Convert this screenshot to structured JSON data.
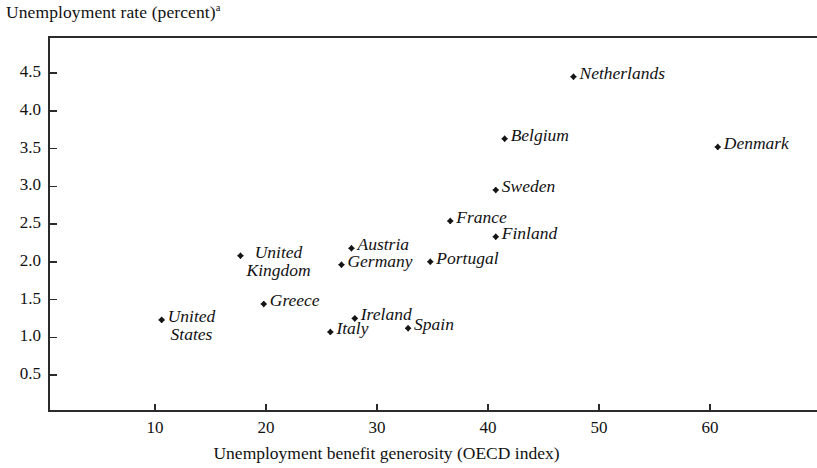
{
  "figure": {
    "y_axis_title": "Unemployment rate (percent)",
    "y_axis_title_superscript": "a",
    "x_axis_title": "Unemployment benefit generosity (OECD index)"
  },
  "chart_data": {
    "type": "scatter",
    "title": "",
    "ylabel": "Unemployment rate (percent)",
    "xlabel": "Unemployment benefit generosity (OECD index)",
    "xlim": [
      0,
      69
    ],
    "ylim": [
      0,
      4.9
    ],
    "xticks": [
      10,
      20,
      30,
      40,
      50,
      60
    ],
    "yticks": [
      0.5,
      1.0,
      1.5,
      2.0,
      2.5,
      3.0,
      3.5,
      4.0,
      4.5
    ],
    "ytick_labels": [
      "0.5",
      "1.0",
      "1.5",
      "2.0",
      "2.5",
      "3.0",
      "3.5",
      "4.0",
      "4.5"
    ],
    "xtick_labels": [
      "10",
      "20",
      "30",
      "40",
      "50",
      "60"
    ],
    "grid": false,
    "legend": false,
    "marker_color": "#151515",
    "points": [
      {
        "label": "United States",
        "label_lines": [
          "United",
          "States"
        ],
        "x": 10.6,
        "y": 1.23,
        "label_pos": "right-2line"
      },
      {
        "label": "United Kingdom",
        "label_lines": [
          "United",
          "Kingdom"
        ],
        "x": 17.7,
        "y": 2.08,
        "label_pos": "right-2line"
      },
      {
        "label": "Greece",
        "label_lines": [
          "Greece"
        ],
        "x": 19.8,
        "y": 1.44,
        "label_pos": "right"
      },
      {
        "label": "Italy",
        "label_lines": [
          "Italy"
        ],
        "x": 25.8,
        "y": 1.07,
        "label_pos": "right"
      },
      {
        "label": "Germany",
        "label_lines": [
          "Germany"
        ],
        "x": 26.8,
        "y": 1.96,
        "label_pos": "right"
      },
      {
        "label": "Austria",
        "label_lines": [
          "Austria"
        ],
        "x": 27.7,
        "y": 2.18,
        "label_pos": "right"
      },
      {
        "label": "Ireland",
        "label_lines": [
          "Ireland"
        ],
        "x": 28.0,
        "y": 1.25,
        "label_pos": "right"
      },
      {
        "label": "Spain",
        "label_lines": [
          "Spain"
        ],
        "x": 32.8,
        "y": 1.12,
        "label_pos": "right"
      },
      {
        "label": "Portugal",
        "label_lines": [
          "Portugal"
        ],
        "x": 34.8,
        "y": 2.0,
        "label_pos": "right"
      },
      {
        "label": "France",
        "label_lines": [
          "France"
        ],
        "x": 36.6,
        "y": 2.54,
        "label_pos": "right"
      },
      {
        "label": "Sweden",
        "label_lines": [
          "Sweden"
        ],
        "x": 40.7,
        "y": 2.95,
        "label_pos": "right"
      },
      {
        "label": "Finland",
        "label_lines": [
          "Finland"
        ],
        "x": 40.7,
        "y": 2.33,
        "label_pos": "right"
      },
      {
        "label": "Belgium",
        "label_lines": [
          "Belgium"
        ],
        "x": 41.5,
        "y": 3.63,
        "label_pos": "right"
      },
      {
        "label": "Netherlands",
        "label_lines": [
          "Netherlands"
        ],
        "x": 47.7,
        "y": 4.45,
        "label_pos": "right"
      },
      {
        "label": "Denmark",
        "label_lines": [
          "Denmark"
        ],
        "x": 60.7,
        "y": 3.52,
        "label_pos": "right"
      }
    ]
  }
}
